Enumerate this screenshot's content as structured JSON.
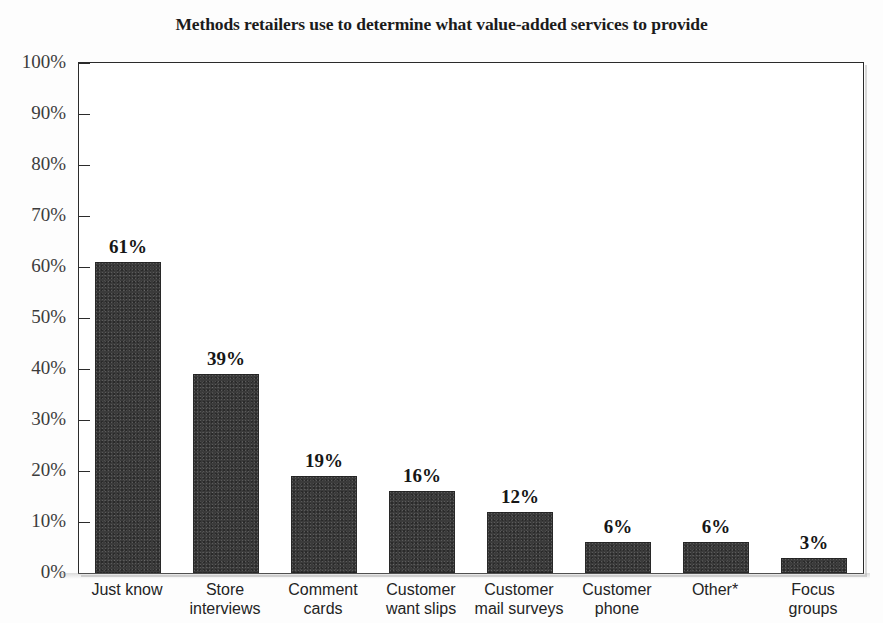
{
  "chart_data": {
    "type": "bar",
    "title": "Methods retailers use to determine what value-added services to provide",
    "xlabel": "",
    "ylabel": "",
    "ylim": [
      0,
      100
    ],
    "yticks": [
      "0%",
      "10%",
      "20%",
      "30%",
      "40%",
      "50%",
      "60%",
      "70%",
      "80%",
      "90%",
      "100%"
    ],
    "ytick_values": [
      0,
      10,
      20,
      30,
      40,
      50,
      60,
      70,
      80,
      90,
      100
    ],
    "grid": false,
    "legend": "none",
    "bar_color": "#3b3b3b",
    "categories": [
      "Just know",
      "Store interviews",
      "Comment cards",
      "Customer want slips",
      "Customer mail surveys",
      "Customer phone",
      "Other*",
      "Focus groups"
    ],
    "category_lines": [
      [
        "Just know",
        ""
      ],
      [
        "Store",
        "interviews"
      ],
      [
        "Comment",
        "cards"
      ],
      [
        "Customer",
        "want slips"
      ],
      [
        "Customer",
        "mail surveys"
      ],
      [
        "Customer",
        "phone"
      ],
      [
        "Other*",
        ""
      ],
      [
        "Focus",
        "groups"
      ]
    ],
    "values": [
      61,
      39,
      19,
      16,
      12,
      6,
      6,
      3
    ],
    "value_labels": [
      "61%",
      "39%",
      "19%",
      "16%",
      "12%",
      "6%",
      "6%",
      "3%"
    ]
  }
}
